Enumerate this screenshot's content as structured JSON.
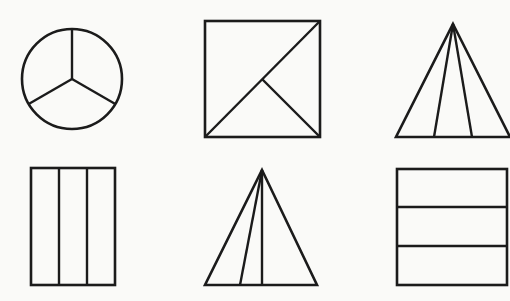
{
  "page": {
    "background_color": "#fafaf8",
    "stroke_color": "#1b1b1b",
    "width": 510,
    "height": 301,
    "columns": 3,
    "rows": 2,
    "shape_count": 6
  },
  "shapes": [
    {
      "id": "circle-thirds",
      "name": "circle divided into three sectors",
      "type": "circle",
      "row": 1,
      "column": 1,
      "parts": 3,
      "equal_parts": true,
      "center": {
        "x": 72,
        "y": 79
      },
      "radius": 50,
      "divider_description": "three radii at 90, 210 and 330 degrees",
      "divider_angles_deg": [
        90,
        210,
        330
      ]
    },
    {
      "id": "square-diagonal",
      "name": "square divided by a diagonal and a half diagonal",
      "type": "square",
      "row": 1,
      "column": 2,
      "parts": 3,
      "equal_parts": false,
      "bounds": {
        "x": 205,
        "y": 21,
        "width": 115,
        "height": 116
      },
      "divider_description": "diagonal from bottom-left to top-right plus segment from centre to bottom-right corner",
      "dividers": [
        {
          "x1": 205,
          "y1": 137,
          "x2": 320,
          "y2": 21
        },
        {
          "x1": 262,
          "y1": 79,
          "x2": 320,
          "y2": 137
        }
      ]
    },
    {
      "id": "triangle-thirds-top",
      "name": "triangle divided into three parts from the apex",
      "type": "triangle",
      "row": 1,
      "column": 3,
      "parts": 3,
      "equal_parts": true,
      "apex": {
        "x": 453,
        "y": 24
      },
      "base_left": {
        "x": 396,
        "y": 137
      },
      "base_right": {
        "x": 510,
        "y": 137
      },
      "divider_description": "two cevians from the apex splitting the base into equal thirds",
      "base_division_points": [
        434,
        472
      ]
    },
    {
      "id": "rectangle-vertical-thirds",
      "name": "rectangle divided into three vertical strips",
      "type": "rectangle",
      "row": 2,
      "column": 1,
      "parts": 3,
      "equal_parts": true,
      "bounds": {
        "x": 31,
        "y": 168,
        "width": 84,
        "height": 117
      },
      "divider_description": "two vertical lines at equal thirds",
      "divider_positions_x": [
        59,
        87
      ]
    },
    {
      "id": "triangle-unequal",
      "name": "triangle divided into three unequal parts from the apex",
      "type": "triangle",
      "row": 2,
      "column": 2,
      "parts": 3,
      "equal_parts": false,
      "apex": {
        "x": 262,
        "y": 170
      },
      "base_left": {
        "x": 205,
        "y": 285
      },
      "base_right": {
        "x": 317,
        "y": 285
      },
      "divider_description": "two cevians from the apex splitting the base unequally",
      "base_division_points": [
        240,
        262
      ]
    },
    {
      "id": "square-horizontal-thirds",
      "name": "square divided into three horizontal strips",
      "type": "square",
      "row": 2,
      "column": 3,
      "parts": 3,
      "equal_parts": true,
      "bounds": {
        "x": 397,
        "y": 169,
        "width": 110,
        "height": 116
      },
      "divider_description": "two horizontal lines at equal thirds",
      "divider_positions_y": [
        207,
        246
      ]
    }
  ]
}
